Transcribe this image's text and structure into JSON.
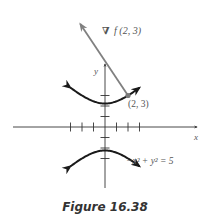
{
  "figure": {
    "caption": "Figure 16.38",
    "gradient_label_symbol": "∇",
    "gradient_label_text": "f (2, 3)",
    "point_label": "(2, 3)",
    "equation_label": "−x² + y² = 5",
    "x_axis_label": "x",
    "y_axis_label": "y",
    "colors": {
      "curve": "#1a1a1a",
      "axes": "#333333",
      "gradient_vector": "#808080",
      "point": "#7a7a7a",
      "text": "#555555"
    }
  },
  "chart_data": {
    "type": "diagram",
    "title": "Figure 16.38",
    "equation": "-x^2 + y^2 = 5",
    "hyperbola": {
      "a_squared": 5,
      "branches": [
        "upper",
        "lower"
      ],
      "x_range": [
        -3,
        3
      ]
    },
    "point": {
      "x": 2,
      "y": 3,
      "label": "(2, 3)"
    },
    "gradient_vector": {
      "from": [
        2,
        3
      ],
      "direction": [
        -4,
        6
      ],
      "label": "∇f(2, 3)"
    },
    "x_ticks": [
      -3,
      -2,
      -1,
      1,
      2,
      3
    ],
    "y_ticks": [
      -3,
      -2,
      -1,
      1,
      2,
      3
    ],
    "xlabel": "x",
    "ylabel": "y"
  }
}
